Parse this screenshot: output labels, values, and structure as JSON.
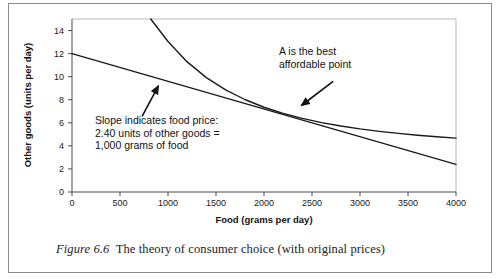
{
  "figure": {
    "caption_label": "Figure 6.6",
    "caption_text": "The theory of consumer choice (with original prices)"
  },
  "chart_data": {
    "type": "line",
    "title": "",
    "xlabel": "Food (grams per day)",
    "ylabel": "Other goods (units per day)",
    "xlim": [
      0,
      4000
    ],
    "ylim": [
      0,
      15
    ],
    "xticks": [
      0,
      500,
      1000,
      1500,
      2000,
      2500,
      3000,
      3500,
      4000
    ],
    "xtick_labels": [
      "0",
      "500",
      "1000",
      "1500",
      "2000",
      "2500",
      "3000",
      "3500",
      "4000"
    ],
    "yticks": [
      0,
      2,
      4,
      6,
      8,
      10,
      12,
      14
    ],
    "ytick_labels": [
      "0",
      "2",
      "4",
      "6",
      "8",
      "10",
      "12",
      "14"
    ],
    "grid": false,
    "legend": "none",
    "series": [
      {
        "name": "Budget line",
        "type": "line",
        "x": [
          0,
          4000
        ],
        "values": [
          12.0,
          2.4
        ]
      },
      {
        "name": "Indifference curve",
        "type": "line",
        "x": [
          820,
          1000,
          1200,
          1400,
          1600,
          1800,
          2000,
          2200,
          2400,
          2600,
          2800,
          3000,
          3200,
          3400,
          3600,
          3800,
          4000
        ],
        "values": [
          15.0,
          13.05,
          11.28,
          9.92,
          8.86,
          8.02,
          7.35,
          6.82,
          6.38,
          6.02,
          5.72,
          5.47,
          5.26,
          5.08,
          4.92,
          4.79,
          4.67
        ]
      }
    ],
    "tangency_point": {
      "label": "A",
      "x": 2200,
      "y": 6.8
    },
    "annotations": [
      {
        "name": "slope-annotation",
        "lines": [
          "Slope indicates food price:",
          "2.40 units of other goods =",
          "1,000 grams of food"
        ],
        "arrow": {
          "from_x": 730,
          "from_y": 6.55,
          "to_x": 900,
          "to_y": 9.2
        }
      },
      {
        "name": "best-point-annotation",
        "lines": [
          "A is the best",
          "affordable point"
        ],
        "arrow": {
          "from_x": 2720,
          "from_y": 9.6,
          "to_x": 2390,
          "to_y": 7.5
        }
      }
    ],
    "colors": {
      "line": "#1a1a1a",
      "axis": "#555555",
      "frame": "#8a8a8a",
      "text": "#111111"
    }
  }
}
